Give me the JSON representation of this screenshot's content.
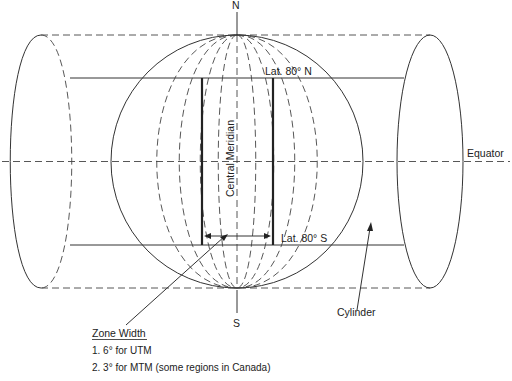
{
  "figure": {
    "labels": {
      "north_pole": "N",
      "south_pole": "S",
      "lat_north": "Lat. 80° N",
      "lat_south": "Lat. 80° S",
      "central_meridian": "Central Meridian",
      "equator": "Equator",
      "cylinder": "Cylinder"
    },
    "zone_width": {
      "heading": "Zone Width",
      "items": [
        "1.  6° for UTM",
        "2.  3° for MTM (some regions in Canada)"
      ]
    },
    "colors": {
      "line": "#333333",
      "background": "#ffffff"
    }
  }
}
